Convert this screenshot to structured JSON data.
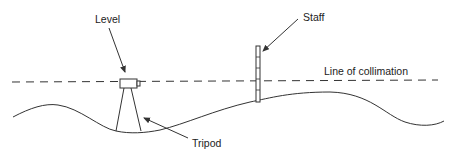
{
  "diagram": {
    "type": "levelling survey schematic",
    "labels": {
      "level": "Level",
      "staff": "Staff",
      "tripod": "Tripod",
      "line_of_collimation": "Line of collimation"
    },
    "components": [
      {
        "id": "level",
        "description": "Levelling instrument mounted on tripod"
      },
      {
        "id": "tripod",
        "description": "Three-legged stand supporting the level"
      },
      {
        "id": "staff",
        "description": "Graduated levelling staff held vertically on ground"
      },
      {
        "id": "line_of_collimation",
        "description": "Horizontal line of sight through the level (dashed)"
      },
      {
        "id": "ground",
        "description": "Undulating ground surface"
      }
    ],
    "colors": {
      "line": "#333333",
      "text": "#222222",
      "background": "#ffffff"
    }
  }
}
